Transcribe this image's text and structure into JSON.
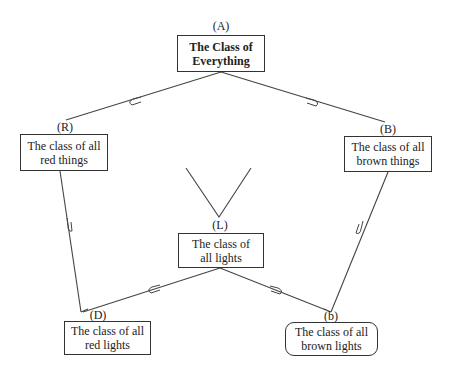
{
  "diagram": {
    "nodes": [
      {
        "id": "A",
        "label": "(A)",
        "text": "The Class of Everything",
        "line1": "The Class of",
        "line2": "Everything",
        "style": "bold"
      },
      {
        "id": "R",
        "label": "(R)",
        "text": "The class of all red things",
        "line1": "The class of all",
        "line2": "red things",
        "style": "normal"
      },
      {
        "id": "B",
        "label": "(B)",
        "text": "The class of all brown things",
        "line1": "The class of all",
        "line2": "brown things",
        "style": "normal"
      },
      {
        "id": "L",
        "label": "(L)",
        "text": "The class of all lights",
        "line1": "The class of",
        "line2": "all lights",
        "style": "normal"
      },
      {
        "id": "D",
        "label": "(D)",
        "text": "The class of all red lights",
        "line1": "The class of all",
        "line2": "red lights",
        "style": "normal"
      },
      {
        "id": "b",
        "label": "(b)",
        "text": "The class of all brown lights",
        "line1": "The class of all",
        "line2": "brown lights",
        "style": "rounded"
      }
    ],
    "edges": [
      {
        "from": "A",
        "to": "R",
        "symbol": "⋐"
      },
      {
        "from": "A",
        "to": "B",
        "symbol": "⋑"
      },
      {
        "from": "R",
        "to": "D",
        "symbol": "⋓"
      },
      {
        "from": "B",
        "to": "b",
        "symbol": "⋓"
      },
      {
        "from": "L",
        "to": "D",
        "symbol": "⋐"
      },
      {
        "from": "L",
        "to": "b",
        "symbol": "⋑"
      }
    ],
    "v_mark": "open V above L"
  }
}
